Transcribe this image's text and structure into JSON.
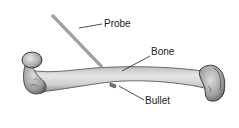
{
  "diagram": {
    "labels": {
      "probe": "Probe",
      "bone": "Bone",
      "bullet": "Bullet"
    }
  },
  "colors": {
    "background": "#ffffff",
    "bone_fill": "#d9d9d9",
    "bone_shadow": "#8a8a8a",
    "bone_outline": "#3a3a3a",
    "probe": "#9a9a9a",
    "text": "#222222"
  }
}
